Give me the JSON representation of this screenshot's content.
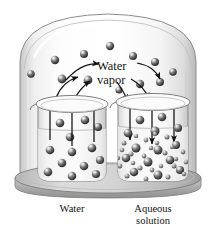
{
  "figure": {
    "title_alt": "Vapor pressure lowering: pure water and aqueous solution under a bell jar",
    "labels": {
      "vapor_line1": "Water",
      "vapor_line2": "vapor",
      "caption_left": "Water",
      "caption_right_line1": "Aqueous",
      "caption_right_line2": "solution"
    },
    "colors": {
      "background": "#ffffff",
      "glass_light": "#fbfbfb",
      "glass_mid": "#e4e4e4",
      "glass_dark": "#bdbdbd",
      "outline": "#6f6f6f",
      "base_top": "#d0d0d0",
      "base_side": "#a9a9a9",
      "particle_dark": "#3b3b3b",
      "particle_mid": "#7d7d7d",
      "particle_light": "#cfcfcf",
      "arrow": "#111111",
      "text": "#141414"
    },
    "bell_jar": {
      "shape": "dome",
      "x": 18,
      "y": 12,
      "width": 182,
      "height": 168
    },
    "base": {
      "shape": "ellipse",
      "cx": 108,
      "cy": 178,
      "rx": 93,
      "ry": 15,
      "thickness": 8
    },
    "beakers": [
      {
        "name": "water-beaker",
        "label": "Water",
        "x": 36,
        "y": 98,
        "width": 72,
        "height": 82,
        "arrow_direction": "up",
        "arrow_count": 3,
        "solvent_particle_count": 13,
        "solute_particle_count": 0,
        "liquid_level_y": 128
      },
      {
        "name": "solution-beaker",
        "label": "Aqueous solution",
        "x": 116,
        "y": 96,
        "width": 74,
        "height": 84,
        "arrow_direction": "down",
        "arrow_count": 3,
        "solvent_particle_count": 14,
        "solute_particle_count": 26,
        "liquid_level_y": 126
      }
    ],
    "vapor_particles": [
      {
        "cx": 110,
        "cy": 46,
        "r": 4.2
      },
      {
        "cx": 84,
        "cy": 54,
        "r": 4.0
      },
      {
        "cx": 133,
        "cy": 56,
        "r": 4.0
      },
      {
        "cx": 55,
        "cy": 60,
        "r": 4.2
      },
      {
        "cx": 155,
        "cy": 62,
        "r": 4.0
      },
      {
        "cx": 62,
        "cy": 79,
        "r": 4.4
      },
      {
        "cx": 88,
        "cy": 80,
        "r": 4.4
      },
      {
        "cx": 140,
        "cy": 84,
        "r": 4.2
      },
      {
        "cx": 160,
        "cy": 82,
        "r": 4.0
      },
      {
        "cx": 31,
        "cy": 74,
        "r": 3.8
      },
      {
        "cx": 173,
        "cy": 72,
        "r": 3.8
      },
      {
        "cx": 119,
        "cy": 90,
        "r": 3.6
      }
    ],
    "curved_arrows": [
      {
        "name": "evaporation-arrow-1",
        "from": [
          66,
          78
        ],
        "to": [
          96,
          66
        ],
        "dir": "up-right"
      },
      {
        "name": "evaporation-arrow-2",
        "from": [
          60,
          96
        ],
        "to": [
          80,
          78
        ],
        "dir": "up-right"
      },
      {
        "name": "evaporation-arrow-3",
        "from": [
          76,
          98
        ],
        "to": [
          90,
          80
        ],
        "dir": "up"
      },
      {
        "name": "condensation-arrow-1",
        "from": [
          136,
          66
        ],
        "to": [
          158,
          80
        ],
        "dir": "down-right"
      },
      {
        "name": "condensation-arrow-2",
        "from": [
          132,
          80
        ],
        "to": [
          148,
          98
        ],
        "dir": "down-right"
      },
      {
        "name": "condensation-arrow-3",
        "from": [
          118,
          84
        ],
        "to": [
          128,
          100
        ],
        "dir": "down"
      }
    ]
  }
}
